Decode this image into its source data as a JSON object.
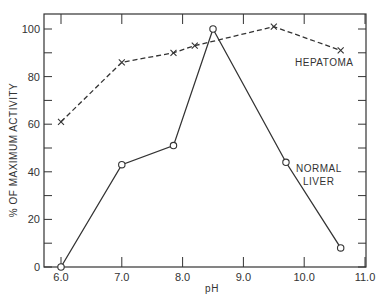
{
  "chart_data": {
    "type": "line",
    "title": "",
    "xlabel": "pH",
    "ylabel": "% OF MAXIMUM ACTIVITY",
    "xlim": [
      5.7,
      11.0
    ],
    "ylim": [
      0,
      105
    ],
    "x_ticks": [
      "6.0",
      "7.0",
      "8.0",
      "9.0",
      "10.0",
      "11.0"
    ],
    "y_ticks": [
      "0",
      "20",
      "40",
      "60",
      "80",
      "100"
    ],
    "grid": false,
    "legend": "inline labels",
    "series": [
      {
        "name": "HEPATOMA",
        "style": "dashed",
        "marker": "x",
        "x": [
          6.0,
          7.0,
          7.85,
          8.2,
          9.5,
          10.6
        ],
        "values": [
          61,
          86,
          90,
          93,
          101,
          91
        ]
      },
      {
        "name": "NORMAL LIVER",
        "style": "solid",
        "marker": "o",
        "x": [
          6.0,
          7.0,
          7.85,
          8.5,
          9.7,
          10.6
        ],
        "values": [
          0,
          43,
          51,
          100,
          44,
          8
        ]
      }
    ],
    "annotations": [
      "HEPATOMA",
      "NORMAL LIVER"
    ]
  },
  "labels": {
    "hepatoma": "HEPATOMA",
    "normal_line1": "NORMAL",
    "normal_line2": "LIVER",
    "xlabel": "pH",
    "ylabel": "% OF MAXIMUM ACTIVITY"
  }
}
